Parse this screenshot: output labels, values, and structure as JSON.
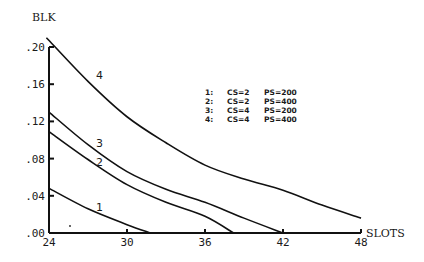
{
  "chart_data": {
    "type": "line",
    "title": "",
    "xlabel": "SLOTS",
    "ylabel": "BLK",
    "xlim": [
      24,
      48
    ],
    "ylim": [
      0,
      0.2
    ],
    "x_ticks": [
      24,
      30,
      36,
      42,
      48
    ],
    "x_tick_labels": [
      "24",
      "30",
      "36",
      "42",
      "48"
    ],
    "y_ticks": [
      0,
      0.04,
      0.08,
      0.12,
      0.16,
      0.2
    ],
    "y_tick_labels": [
      ".00",
      ".04",
      ".08",
      ".12",
      ".16",
      ".20"
    ],
    "grid": false,
    "legend_position": "upper-right-inside",
    "legend": [
      {
        "id": "1:",
        "cs": "CS=2",
        "ps": "PS=200"
      },
      {
        "id": "2:",
        "cs": "CS=2",
        "ps": "PS=400"
      },
      {
        "id": "3:",
        "cs": "CS=4",
        "ps": "PS=200"
      },
      {
        "id": "4:",
        "cs": "CS=4",
        "ps": "PS=400"
      }
    ],
    "series": [
      {
        "name": "1",
        "label": "CS=2 PS=200",
        "x": [
          24,
          27,
          30,
          31.8
        ],
        "y": [
          0.048,
          0.026,
          0.009,
          0.0
        ]
      },
      {
        "name": "2",
        "label": "CS=2 PS=400",
        "x": [
          24,
          27,
          30,
          33,
          36,
          38.2
        ],
        "y": [
          0.109,
          0.079,
          0.052,
          0.033,
          0.018,
          0.0
        ]
      },
      {
        "name": "3",
        "label": "CS=4 PS=200",
        "x": [
          24,
          27,
          30,
          33,
          36,
          39,
          42
        ],
        "y": [
          0.13,
          0.095,
          0.066,
          0.047,
          0.033,
          0.016,
          0.0
        ]
      },
      {
        "name": "4",
        "label": "CS=4 PS=400",
        "x": [
          23.8,
          27,
          30,
          33,
          36,
          39,
          42,
          45,
          48
        ],
        "y": [
          0.21,
          0.163,
          0.125,
          0.097,
          0.073,
          0.058,
          0.046,
          0.03,
          0.016
        ]
      }
    ]
  },
  "labels": {
    "ylabel": "BLK",
    "xlabel": "SLOTS",
    "curve1": "1",
    "curve2": "2",
    "curve3": "3",
    "curve4": "4"
  }
}
